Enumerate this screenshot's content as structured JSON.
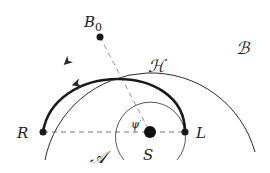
{
  "diagram": {
    "type": "orbit-geometry",
    "colors": {
      "stroke": "#2a2a2a",
      "background": "#ffffff"
    },
    "points": {
      "B0": {
        "label": "B",
        "subscript": "0",
        "x": 100,
        "y": 37
      },
      "R": {
        "label": "R",
        "x": 43,
        "y": 132
      },
      "S": {
        "label": "S",
        "x": 150,
        "y": 132
      },
      "L": {
        "label": "L",
        "x": 185,
        "y": 132
      }
    },
    "regions": {
      "outer": {
        "label": "ℬ"
      },
      "curve": {
        "label": "ℋ"
      },
      "inner": {
        "label": "𝒜"
      }
    },
    "angle": {
      "label": "ψ"
    }
  }
}
